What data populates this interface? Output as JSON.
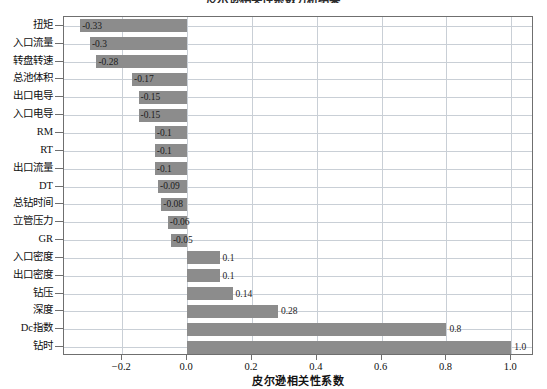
{
  "chart_data": {
    "type": "bar",
    "orientation": "horizontal",
    "title": "皮尔逊相关性系数分析结果",
    "xlabel": "皮尔逊相关性系数",
    "ylabel": "",
    "xlim": [
      -0.38,
      1.07
    ],
    "xticks": [
      -0.2,
      0.0,
      0.2,
      0.4,
      0.6,
      0.8,
      1.0
    ],
    "xticklabels": [
      "−0.2",
      "0.0",
      "0.2",
      "0.4",
      "0.6",
      "0.8",
      "1.0"
    ],
    "grid": true,
    "legend": false,
    "bar_color": "#8c8c8c",
    "categories": [
      "扭矩",
      "入口流量",
      "转盘转速",
      "总池体积",
      "出口电导",
      "入口电导",
      "RM",
      "RT",
      "出口流量",
      "DT",
      "总钻时间",
      "立管压力",
      "GR",
      "入口密度",
      "出口密度",
      "钻压",
      "深度",
      "Dc指数",
      "钻时"
    ],
    "values": [
      -0.33,
      -0.3,
      -0.28,
      -0.17,
      -0.15,
      -0.15,
      -0.1,
      -0.1,
      -0.1,
      -0.09,
      -0.08,
      -0.06,
      -0.05,
      0.1,
      0.1,
      0.14,
      0.28,
      0.8,
      1.0
    ],
    "datalabels": [
      "-0.33",
      "-0.3",
      "-0.28",
      "-0.17",
      "-0.15",
      "-0.15",
      "-0.1",
      "-0.1",
      "-0.1",
      "-0.09",
      "-0.08",
      "-0.06",
      "-0.05",
      "0.1",
      "0.1",
      "0.14",
      "0.28",
      "0.8",
      "1.0"
    ]
  }
}
